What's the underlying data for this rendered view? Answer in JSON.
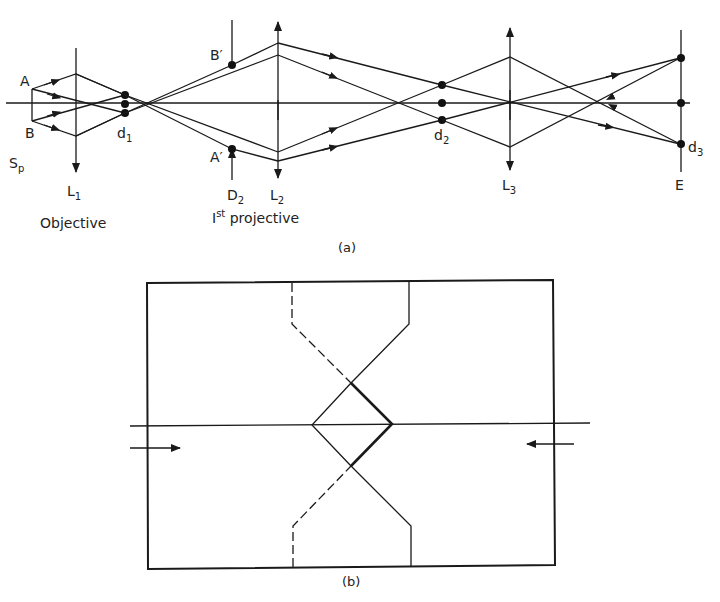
{
  "figure_a": {
    "caption": "(a)",
    "labels": {
      "A": "A",
      "B": "B",
      "Sp_main": "S",
      "Sp_sub": "p",
      "L1_main": "L",
      "L1_sub": "1",
      "d1_main": "d",
      "d1_sub": "1",
      "B_prime": "B′",
      "A_prime": "A′",
      "D2_main": "D",
      "D2_sub": "2",
      "L2_main": "L",
      "L2_sub": "2",
      "d2_main": "d",
      "d2_sub": "2",
      "L3_main": "L",
      "L3_sub": "3",
      "E": "E",
      "d3_main": "d",
      "d3_sub": "3",
      "objective": "Objective",
      "projective_prefix": "I",
      "projective_sup": "st",
      "projective_suffix": " projective"
    }
  },
  "figure_b": {
    "caption": "(b)"
  },
  "colors": {
    "line": "#1a1a1a",
    "background": "#ffffff"
  }
}
